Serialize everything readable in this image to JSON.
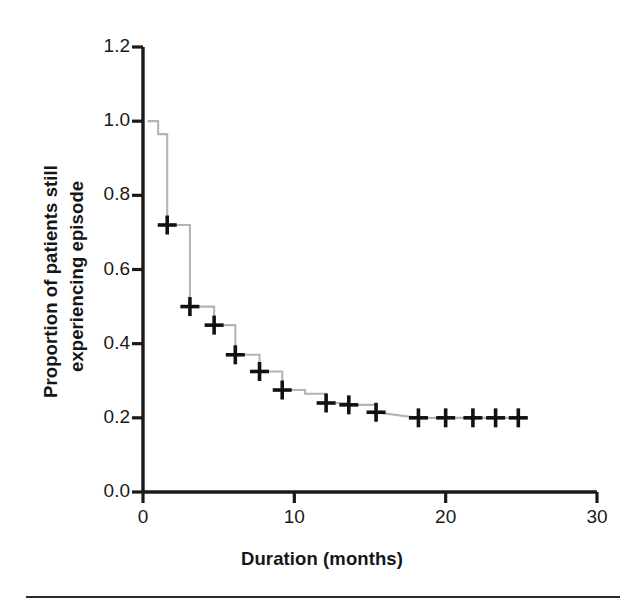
{
  "figure": {
    "background": "#ffffff",
    "axis_color": "#1a1a1a",
    "curve_color": "#b0b0b0",
    "censor_color": "#111111"
  },
  "chart_data": {
    "type": "line",
    "subtype": "kaplan-meier-step",
    "title": "",
    "xlabel": "Duration (months)",
    "ylabel_line1": "Proportion of patients still",
    "ylabel_line2": "experiencing episode",
    "ylabel": "Proportion of patients still experiencing episode",
    "xlim": [
      0,
      30
    ],
    "ylim": [
      0.0,
      1.2
    ],
    "xticks": [
      0,
      10,
      20,
      30
    ],
    "xtick_labels": [
      "0",
      "10",
      "20",
      "30"
    ],
    "yticks": [
      0.0,
      0.2,
      0.4,
      0.6,
      0.8,
      1.0,
      1.2
    ],
    "ytick_labels": [
      "0.0",
      "0.2",
      "0.4",
      "0.6",
      "0.8",
      "1.0",
      "1.2"
    ],
    "grid": false,
    "legend": null,
    "series": [
      {
        "name": "Survival function",
        "step": "post",
        "x": [
          0.3,
          1.0,
          1.0,
          1.6,
          1.6,
          3.1,
          3.1,
          4.7,
          4.7,
          6.1,
          6.1,
          7.7,
          7.7,
          9.2,
          9.2,
          10.7,
          10.7,
          12.1,
          12.1,
          13.6,
          13.6,
          15.4,
          15.4,
          18.2,
          24.8
        ],
        "y": [
          1.0,
          1.0,
          0.965,
          0.965,
          0.72,
          0.72,
          0.5,
          0.5,
          0.45,
          0.45,
          0.37,
          0.37,
          0.325,
          0.325,
          0.275,
          0.275,
          0.265,
          0.265,
          0.24,
          0.24,
          0.235,
          0.235,
          0.215,
          0.2,
          0.2
        ]
      }
    ],
    "censor_marks": [
      {
        "x": 1.6,
        "y": 0.72
      },
      {
        "x": 3.1,
        "y": 0.5
      },
      {
        "x": 4.7,
        "y": 0.45
      },
      {
        "x": 6.1,
        "y": 0.37
      },
      {
        "x": 7.7,
        "y": 0.325
      },
      {
        "x": 9.2,
        "y": 0.275
      },
      {
        "x": 12.1,
        "y": 0.24
      },
      {
        "x": 13.6,
        "y": 0.235
      },
      {
        "x": 15.4,
        "y": 0.215
      },
      {
        "x": 18.2,
        "y": 0.2
      },
      {
        "x": 20.0,
        "y": 0.2
      },
      {
        "x": 21.8,
        "y": 0.2
      },
      {
        "x": 23.3,
        "y": 0.2
      },
      {
        "x": 24.8,
        "y": 0.2
      }
    ]
  }
}
